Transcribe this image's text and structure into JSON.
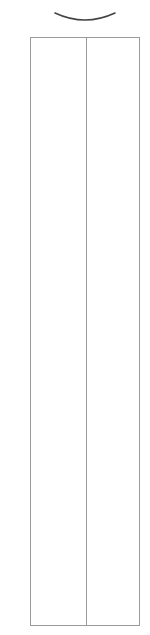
{
  "figure": {
    "arc": {
      "stroke": "#444444"
    },
    "container": {
      "border_color": "#9a9a9a",
      "columns": [
        {
          "id": "left"
        },
        {
          "id": "right"
        }
      ]
    }
  }
}
